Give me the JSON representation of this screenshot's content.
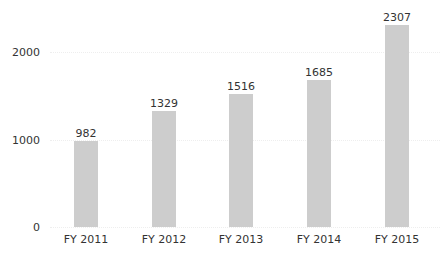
{
  "chart_data": {
    "type": "bar",
    "title": "",
    "xlabel": "",
    "ylabel": "",
    "categories": [
      "FY 2011",
      "FY 2012",
      "FY 2013",
      "FY 2014",
      "FY 2015"
    ],
    "values": [
      982,
      1329,
      1516,
      1685,
      2307
    ],
    "data_labels": [
      "982",
      "1329",
      "1516",
      "1685",
      "2307"
    ],
    "yticks": [
      0,
      1000,
      2000
    ],
    "ytick_labels": [
      "0",
      "1000",
      "2000"
    ],
    "ylim": [
      0,
      2400
    ],
    "grid": true,
    "legend": null,
    "bar_color": "#cdcdcd"
  }
}
